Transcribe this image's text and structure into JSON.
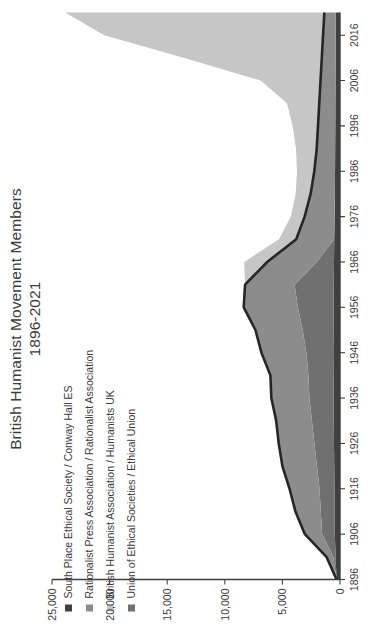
{
  "chart_data": {
    "type": "area",
    "stacked": true,
    "title": "British Humanist Movement Members",
    "subtitle": "1896-2021",
    "xlabel": "",
    "ylabel": "",
    "xlim": [
      1896,
      2021
    ],
    "ylim": [
      0,
      25000
    ],
    "grid": false,
    "legend_position": "top-left",
    "x_ticks": [
      "1896",
      "1906",
      "1916",
      "1926",
      "1936",
      "1946",
      "1956",
      "1966",
      "1976",
      "1986",
      "1996",
      "2006",
      "2016"
    ],
    "y_ticks": [
      "0",
      "5,000",
      "10,000",
      "15,000",
      "20,000",
      "25,000"
    ],
    "colors": {
      "south_place": "#404040",
      "rationalist_press": "#8c8c8c",
      "british_humanist": "#c6c6c6",
      "union_ethical": "#707070",
      "outline": "#262626",
      "axis": "#3f3f3f",
      "text": "#3b3b3b"
    },
    "series": [
      {
        "name": "South Place Ethical Society / Conway Hall ES",
        "color": "#404040",
        "x": [
          1896,
          1901,
          1906,
          1911,
          1916,
          1921,
          1926,
          1931,
          1936,
          1941,
          1946,
          1951,
          1956,
          1961,
          1966,
          1971,
          1976,
          1981,
          1986,
          1991,
          1996,
          2001,
          2006,
          2011,
          2016,
          2021
        ],
        "values": [
          300,
          380,
          450,
          470,
          480,
          500,
          520,
          540,
          560,
          540,
          520,
          540,
          560,
          540,
          520,
          500,
          470,
          450,
          430,
          420,
          410,
          400,
          390,
          380,
          370,
          360
        ]
      },
      {
        "name": "Rationalist Press Association / Rationalist Association",
        "color": "#8c8c8c",
        "x": [
          1896,
          1901,
          1906,
          1911,
          1916,
          1921,
          1926,
          1931,
          1936,
          1941,
          1946,
          1951,
          1956,
          1961,
          1966,
          1971,
          1976,
          1981,
          1986,
          1991,
          1996,
          2001,
          2006,
          2011,
          2016,
          2021
        ],
        "values": [
          0,
          600,
          1500,
          2200,
          2600,
          3000,
          3100,
          3100,
          3300,
          3300,
          3900,
          4100,
          4700,
          4300,
          4300,
          3300,
          2600,
          2100,
          1800,
          1600,
          1500,
          1400,
          1300,
          1200,
          1100,
          1000
        ]
      },
      {
        "name": "British Humanist Association  / Humanists UK",
        "color": "#c6c6c6",
        "x": [
          1896,
          1901,
          1906,
          1911,
          1916,
          1921,
          1926,
          1931,
          1936,
          1941,
          1946,
          1951,
          1956,
          1961,
          1966,
          1971,
          1976,
          1981,
          1986,
          1991,
          1996,
          2001,
          2006,
          2011,
          2016,
          2021
        ],
        "values": [
          0,
          0,
          0,
          0,
          0,
          0,
          0,
          0,
          0,
          0,
          0,
          0,
          0,
          0,
          2000,
          1500,
          1200,
          1300,
          1500,
          1800,
          2200,
          2800,
          5200,
          12000,
          19000,
          22500
        ]
      },
      {
        "name": "Union of Ethical Societies / Ethical Union",
        "color": "#707070",
        "x": [
          1896,
          1901,
          1906,
          1911,
          1916,
          1921,
          1926,
          1931,
          1936,
          1941,
          1946,
          1951,
          1956,
          1961,
          1966,
          1971,
          1976,
          1981,
          1986,
          1991,
          1996,
          2001,
          2006,
          2011,
          2016,
          2021
        ],
        "values": [
          0,
          200,
          1100,
          1200,
          1300,
          1500,
          1700,
          1900,
          2100,
          2200,
          2400,
          2700,
          3100,
          3400,
          1500,
          0,
          0,
          0,
          0,
          0,
          0,
          0,
          0,
          0,
          0,
          0
        ]
      }
    ],
    "stack_totals": {
      "note": "visual stacked envelope peaks near 8,000 around 1966 and rises to ~23,900 by 2021"
    }
  },
  "legend": {
    "items": [
      {
        "label": "South Place Ethical Society / Conway Hall ES",
        "color": "#404040"
      },
      {
        "label": "Rationalist Press Association / Rationalist Association",
        "color": "#8c8c8c"
      },
      {
        "label": "British Humanist Association  / Humanists UK",
        "color": "#c6c6c6"
      },
      {
        "label": "Union of Ethical Societies / Ethical Union",
        "color": "#707070"
      }
    ]
  },
  "title": {
    "line1": "British Humanist Movement Members",
    "line2": "1896-2021"
  }
}
